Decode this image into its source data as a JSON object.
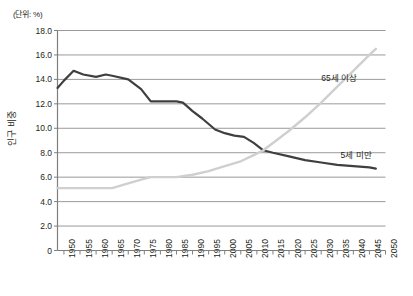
{
  "chart_data": {
    "type": "line",
    "title": "",
    "subtitle": "",
    "unit_note": "(단위: %)",
    "xlabel": "",
    "ylabel": "인구 비중",
    "xlim": [
      1948,
      2050
    ],
    "ylim": [
      0,
      18
    ],
    "ytick_step": 2.0,
    "grid": "horizontal",
    "legend": "inline-annotation",
    "ytick_labels": [
      "18.0",
      "16.0",
      "14.0",
      "12.0",
      "10.0",
      "8.0",
      "6.0",
      "4.0",
      "2.0",
      "0"
    ],
    "ytick_values": [
      18,
      16,
      14,
      12,
      10,
      8,
      6,
      4,
      2,
      0
    ],
    "xtick_labels": [
      "1950",
      "1955",
      "1960",
      "1965",
      "1970",
      "1975",
      "1980",
      "1985",
      "1990",
      "1995",
      "2000",
      "2005",
      "2010",
      "2015",
      "2020",
      "2025",
      "2030",
      "2035",
      "2040",
      "2045",
      "2050"
    ],
    "xtick_values": [
      1950,
      1955,
      1960,
      1965,
      1970,
      1975,
      1980,
      1985,
      1990,
      1995,
      2000,
      2005,
      2010,
      2015,
      2020,
      2025,
      2030,
      2035,
      2040,
      2045,
      2050
    ],
    "series": [
      {
        "name": "5세 미만",
        "color": "#3f3f3f",
        "label_x": 2036,
        "label_y": 7.9,
        "x": [
          1948,
          1950,
          1953,
          1956,
          1960,
          1963,
          1965,
          1970,
          1974,
          1977,
          1980,
          1985,
          1987,
          1990,
          1993,
          1997,
          2000,
          2003,
          2006,
          2009,
          2012,
          2015,
          2020,
          2025,
          2030,
          2035,
          2040,
          2045,
          2047
        ],
        "values": [
          13.3,
          13.9,
          14.7,
          14.4,
          14.2,
          14.4,
          14.3,
          14.0,
          13.2,
          12.2,
          12.2,
          12.2,
          12.1,
          11.4,
          10.8,
          9.9,
          9.6,
          9.4,
          9.3,
          8.8,
          8.2,
          8.0,
          7.7,
          7.4,
          7.2,
          7.0,
          6.9,
          6.8,
          6.7
        ]
      },
      {
        "name": "65세 이상",
        "color": "#cfcfcf",
        "label_x": 2030,
        "label_y": 14.2,
        "x": [
          1948,
          1955,
          1960,
          1965,
          1970,
          1974,
          1977,
          1980,
          1985,
          1990,
          1995,
          2000,
          2005,
          2009,
          2012,
          2015,
          2020,
          2025,
          2030,
          2035,
          2040,
          2045,
          2047
        ],
        "values": [
          5.1,
          5.1,
          5.1,
          5.1,
          5.5,
          5.8,
          6.0,
          6.0,
          6.0,
          6.2,
          6.5,
          6.9,
          7.3,
          7.8,
          8.2,
          8.8,
          9.8,
          10.9,
          12.1,
          13.4,
          14.7,
          16.0,
          16.5
        ]
      }
    ]
  },
  "axis": {
    "axis_color": "#7f7f7f",
    "grid_color": "#9a9a9a",
    "text_color": "#231f20"
  }
}
